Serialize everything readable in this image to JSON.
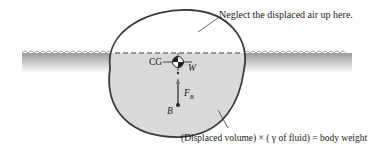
{
  "diagram": {
    "labels": {
      "top_note": "Neglect the displaced air up here.",
      "cg": "CG",
      "weight": "W",
      "buoyant_force_main": "F",
      "buoyant_force_sub": "B",
      "buoyancy_center": "B",
      "bottom_note": "(Displaced volume) × ( γ of fluid) = body weight"
    },
    "colors": {
      "outline": "#3a3a3a",
      "submerged_fill": "#d9d9d9",
      "water_top": "#9a9a9a",
      "water_bottom": "#ffffff",
      "text": "#1a1a1a"
    }
  }
}
